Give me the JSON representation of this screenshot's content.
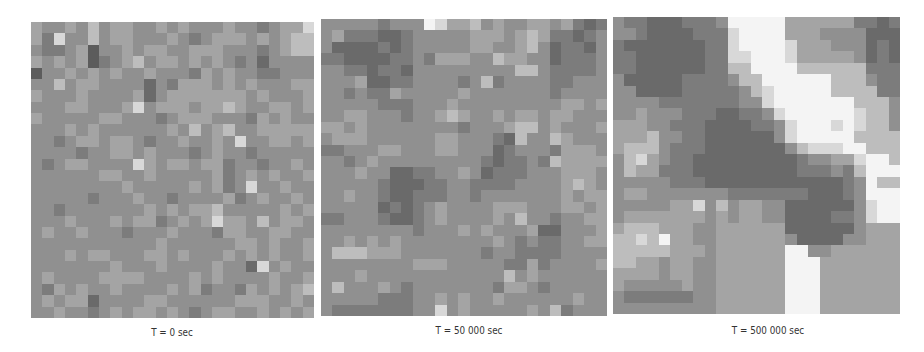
{
  "figure": {
    "panels": [
      {
        "label": "T = 0 sec",
        "cols": 25,
        "rows": 26,
        "grid": [
          "6556575665565655565545668",
          "6485575665556545666565677",
          "5445625565665566655545677",
          "6565624567566565654535555",
          "2556565655655546565544555",
          "5575665555354666565655566",
          "6555655556356666666565556",
          "5556655568566656676556656",
          "6555556655545666555465655",
          "5556565555556575675566666",
          "5545665665455655658556656",
          "5555455665655545655455555",
          "5456655558656656645545565",
          "5555556655655555645656556",
          "5555555565555565645855655",
          "5555545556554555564565565",
          "5545555555656566755555656",
          "5556555656645656866575665",
          "5655655545556555466556655",
          "5555555555565555556656556",
          "5556566555665655565656556",
          "5555555655565555655385655",
          "5655556666555565655556556",
          "5465655655556564554656567",
          "5656635555665555556665565",
          "5565545656656545665565656"
        ]
      },
      {
        "label": "T = 50 000 sec",
        "cols": 25,
        "rows": 26,
        "grid": [
          "5555545559866756556656434",
          "5644433455555666567644345",
          "5333343455555665567534435",
          "4433334454666557665534445",
          "5544344355555555577544445",
          "5556334455554574555544555",
          "5545446555556555555545555",
          "5555544455565555555556656",
          "5566555455676556566566555",
          "6656555555554555677565556",
          "5666555555665554375576555",
          "4455566555665553455546665",
          "5545655555555543445476666",
          "5556553344556534445556665",
          "5555543334455444455556765",
          "5565543344455455555556566",
          "5555534345655556665556656",
          "4455543345655556575545566",
          "5555555545556565556335556",
          "5565656555555556545445566",
          "5777666555555545544445555",
          "5555555566655555446455556",
          "5556555555555555756555555",
          "5755565455555554665455555",
          "5555544455656556555555655",
          "5444444455856555556574555"
        ]
      },
      {
        "label": "T = 500 000 sec",
        "cols": 25,
        "rows": 26,
        "grid": [
          "5443334445999996666664434",
          "5543333444899996665555333",
          "4333333344899998666555343",
          "4433333344889998666665343",
          "4433333344779999777777444",
          "5333334444577999999777544",
          "5533334444457899999777744",
          "5555444444455899999997775",
          "5565554443344589999998775",
          "6665544433334458999898775",
          "6667554433333358999997777",
          "6777544433333335788899777",
          "5786544333333333455668997",
          "5766444333333333444547999",
          "5555544433333333333345977",
          "5665555555444444433345999",
          "5555566857566553333335899",
          "5666666656566553333445899",
          "6777666556666663333335666",
          "7787966556666665333355666",
          "7777766656666669955666666",
          "7766566556666669996666666",
          "6666566556666669996666666",
          "6555556556666669996666666",
          "5444444556666669996666666",
          "5555555556666669996666666"
        ]
      }
    ],
    "gray_scale": [
      "#3a3a3a",
      "#4a4a4a",
      "#5c5c5c",
      "#6a6a6a",
      "#7c7c7c",
      "#909090",
      "#a4a4a4",
      "#bdbdbd",
      "#d8d8d8",
      "#f4f4f4"
    ]
  }
}
